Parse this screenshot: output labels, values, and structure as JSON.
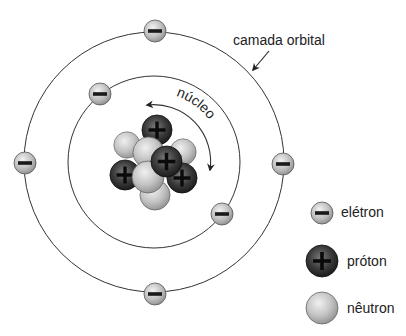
{
  "diagram": {
    "labels": {
      "orbital_shell": "camada orbital",
      "nucleus": "núcleo"
    },
    "legend": [
      {
        "type": "electron",
        "symbol": "−",
        "label": "elétron"
      },
      {
        "type": "proton",
        "symbol": "+",
        "label": "próton"
      },
      {
        "type": "neutron",
        "symbol": "",
        "label": "nêutron"
      }
    ],
    "orbits": [
      {
        "name": "inner",
        "electrons": 2
      },
      {
        "name": "outer",
        "electrons": 4
      }
    ],
    "nucleus": {
      "protons": 4,
      "neutrons": 5
    },
    "colors": {
      "electron": "#b9b9b9",
      "proton": "#2a2a2a",
      "neutron": "#c8c8c8",
      "line": "#333333",
      "background": "#ffffff"
    }
  }
}
